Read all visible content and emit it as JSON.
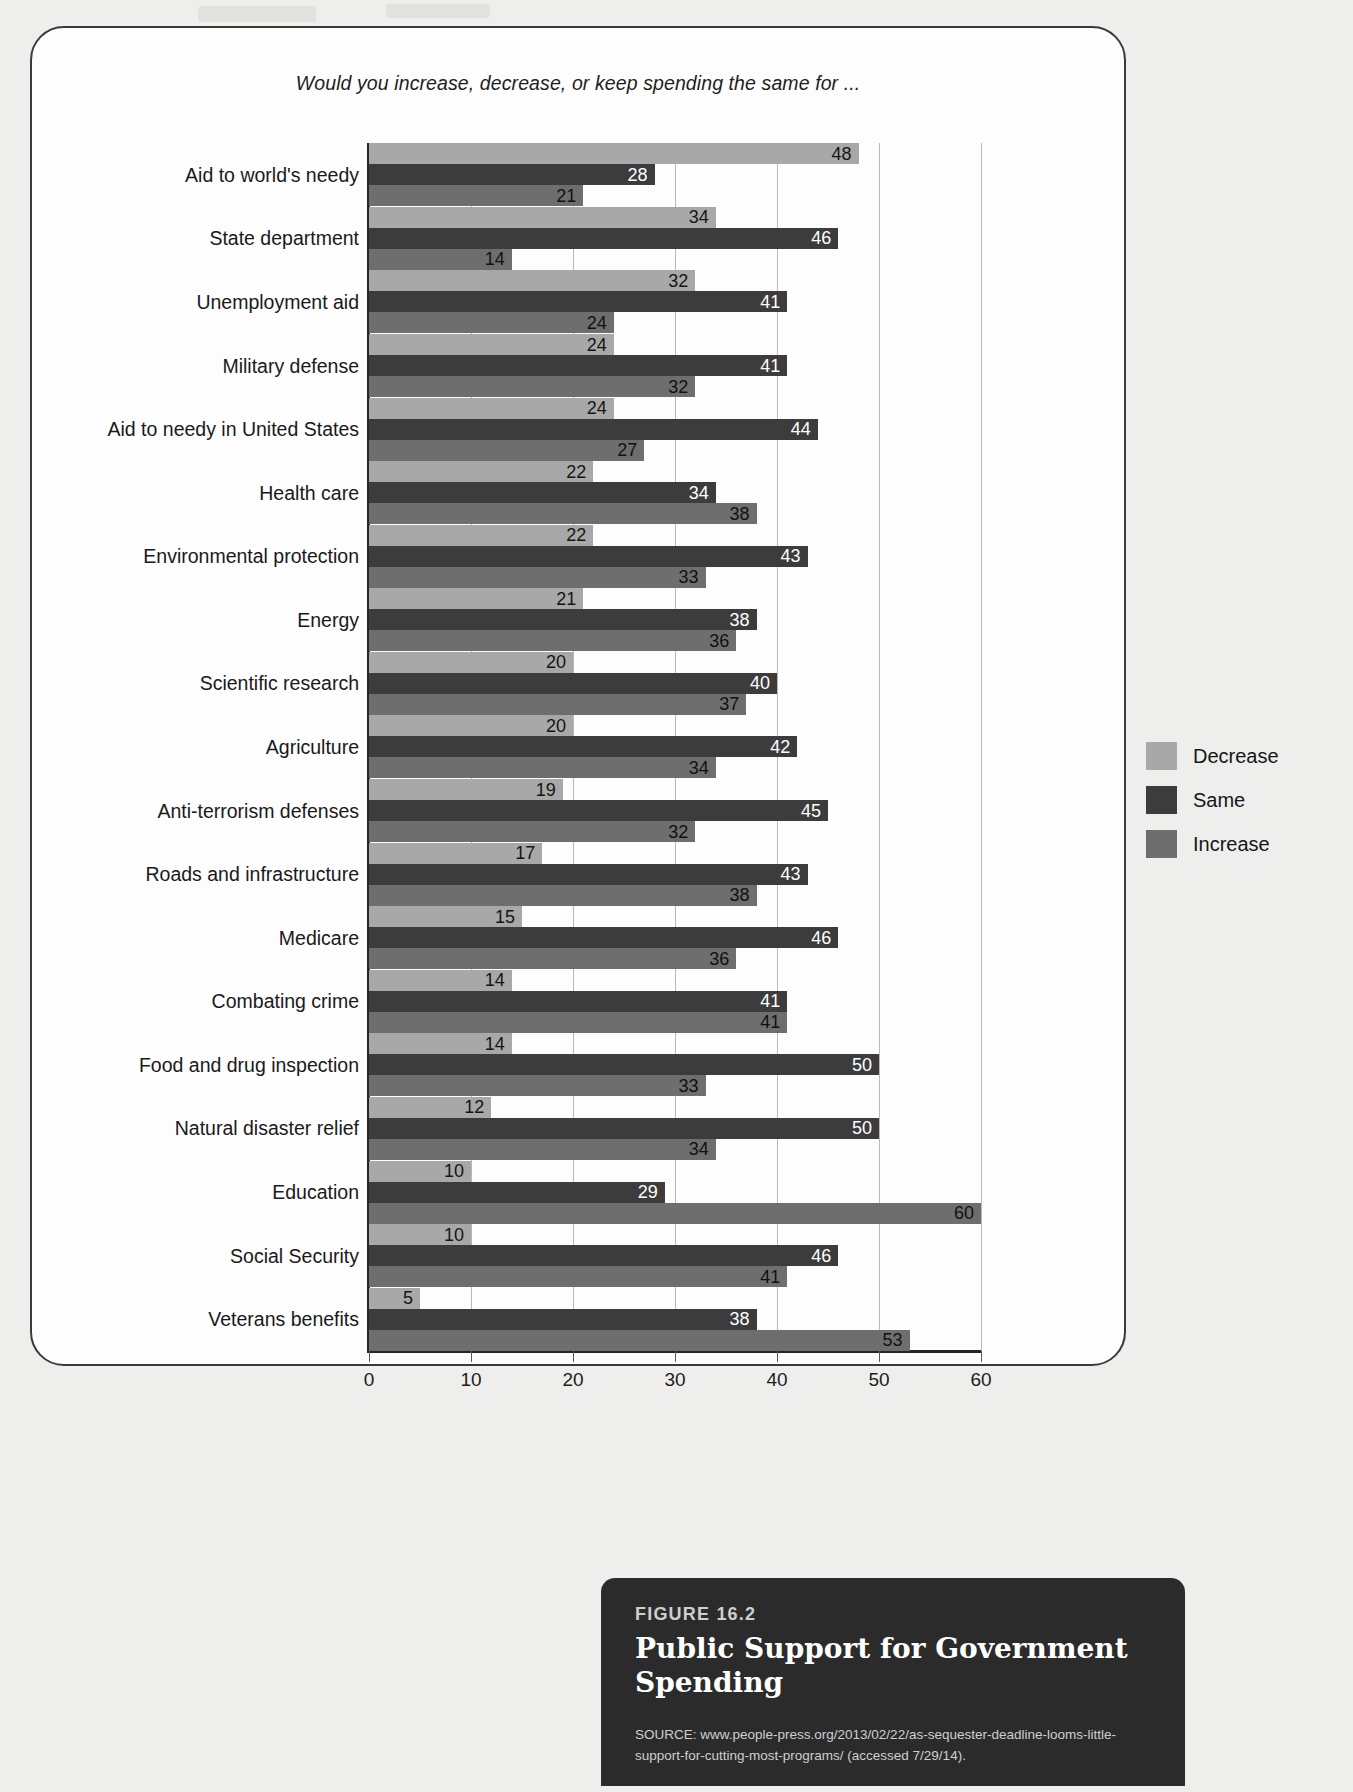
{
  "figure": {
    "number_label": "FIGURE 16.2",
    "title": "Public Support for Government Spending",
    "source": "SOURCE: www.people-press.org/2013/02/22/as-sequester-deadline-looms-little-support-for-cutting-most-programs/ (accessed 7/29/14)."
  },
  "legend": {
    "items": [
      {
        "label": "Decrease",
        "color": "#a8a8a8"
      },
      {
        "label": "Same",
        "color": "#3c3c3c"
      },
      {
        "label": "Increase",
        "color": "#6e6e6e"
      }
    ]
  },
  "chart_data": {
    "type": "bar",
    "orientation": "horizontal",
    "title": "Would you increase, decrease, or keep spending the same for ...",
    "xlabel": "",
    "ylabel": "",
    "xlim": [
      0,
      60
    ],
    "xticks": [
      0,
      10,
      20,
      30,
      40,
      50,
      60
    ],
    "xtick_labels": [
      "0",
      "10",
      "20",
      "30",
      "40",
      "50",
      "60"
    ],
    "grid": true,
    "legend_position": "right",
    "categories": [
      "Aid to world's needy",
      "State department",
      "Unemployment aid",
      "Military defense",
      "Aid to needy in United States",
      "Health care",
      "Environmental protection",
      "Energy",
      "Scientific research",
      "Agriculture",
      "Anti-terrorism defenses",
      "Roads and infrastructure",
      "Medicare",
      "Combating crime",
      "Food and drug inspection",
      "Natural disaster relief",
      "Education",
      "Social Security",
      "Veterans benefits"
    ],
    "series": [
      {
        "name": "Decrease",
        "color": "#a8a8a8",
        "values": [
          48,
          34,
          32,
          24,
          24,
          22,
          22,
          21,
          20,
          20,
          19,
          17,
          15,
          14,
          14,
          12,
          10,
          10,
          5
        ]
      },
      {
        "name": "Same",
        "color": "#3c3c3c",
        "values": [
          28,
          46,
          41,
          41,
          44,
          34,
          43,
          38,
          40,
          42,
          45,
          43,
          46,
          41,
          50,
          50,
          29,
          46,
          38
        ]
      },
      {
        "name": "Increase",
        "color": "#6e6e6e",
        "values": [
          21,
          14,
          24,
          32,
          27,
          38,
          33,
          36,
          37,
          34,
          32,
          38,
          36,
          41,
          33,
          34,
          60,
          41,
          53
        ]
      }
    ]
  }
}
